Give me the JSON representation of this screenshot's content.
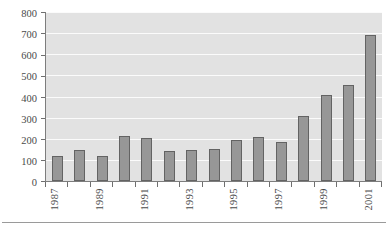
{
  "chart_data": {
    "type": "bar",
    "title": "",
    "subtitle": "",
    "xlabel": "",
    "ylabel": "",
    "categories": [
      "1987",
      "1988",
      "1989",
      "1990",
      "1991",
      "1992",
      "1993",
      "1994",
      "1995",
      "1996",
      "1997",
      "1998",
      "1999",
      "2000",
      "2001"
    ],
    "values": [
      120,
      148,
      118,
      215,
      203,
      143,
      145,
      150,
      192,
      208,
      187,
      310,
      408,
      455,
      690
    ],
    "visible_tick_labels": [
      "1987",
      "1989",
      "1991",
      "1993",
      "1995",
      "1997",
      "1999",
      "2001"
    ],
    "ylim": [
      0,
      800
    ],
    "ytick_values": [
      0,
      100,
      200,
      300,
      400,
      500,
      600,
      700,
      800
    ],
    "ytick_labels": [
      "0",
      "100",
      "200",
      "300",
      "400",
      "500",
      "600",
      "700",
      "800"
    ],
    "grid": true,
    "grid_orientation": "horizontal",
    "legend": null,
    "legend_position": "none",
    "annotations": [],
    "colors": {
      "bar_fill": "#979797",
      "bar_border": "#636363",
      "plot_background": "#e2e2e2",
      "gridline": "#fbfbfb",
      "axis_line": "#7d7d7d",
      "tick_label": "#4a4a4a",
      "figure_background": "#ffffff",
      "bottom_rule": "#9a9a9a"
    }
  }
}
